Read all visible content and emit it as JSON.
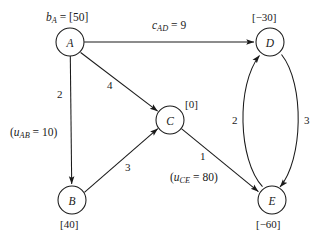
{
  "diagram": {
    "type": "network-flow-graph",
    "background_color": "#ffffff",
    "stroke_color": "#1a1a1a",
    "nodes": [
      {
        "id": "A",
        "letter": "A",
        "supply_label": "[50]",
        "supply_value": 50,
        "x": 70,
        "y": 42,
        "r": 14
      },
      {
        "id": "B",
        "letter": "B",
        "supply_label": "[40]",
        "supply_value": 40,
        "x": 72,
        "y": 200,
        "r": 14
      },
      {
        "id": "C",
        "letter": "C",
        "supply_label": "[0]",
        "supply_value": 0,
        "x": 170,
        "y": 120,
        "r": 14
      },
      {
        "id": "D",
        "letter": "D",
        "supply_label": "[−30]",
        "supply_value": -30,
        "x": 270,
        "y": 42,
        "r": 14
      },
      {
        "id": "E",
        "letter": "E",
        "supply_label": "[−60]",
        "supply_value": -60,
        "x": 272,
        "y": 200,
        "r": 14
      }
    ],
    "edges": [
      {
        "from": "A",
        "to": "D",
        "cost": 9,
        "cost_label": "9",
        "capacity": null,
        "shape": "straight"
      },
      {
        "from": "A",
        "to": "C",
        "cost": 4,
        "cost_label": "4",
        "capacity": null,
        "shape": "straight"
      },
      {
        "from": "A",
        "to": "B",
        "cost": 2,
        "cost_label": "2",
        "capacity": 10,
        "shape": "straight"
      },
      {
        "from": "B",
        "to": "C",
        "cost": 3,
        "cost_label": "3",
        "capacity": null,
        "shape": "straight"
      },
      {
        "from": "C",
        "to": "E",
        "cost": 1,
        "cost_label": "1",
        "capacity": 80,
        "shape": "straight"
      },
      {
        "from": "E",
        "to": "D",
        "cost": 2,
        "cost_label": "2",
        "capacity": null,
        "shape": "curved-left"
      },
      {
        "from": "D",
        "to": "E",
        "cost": 3,
        "cost_label": "3",
        "capacity": null,
        "shape": "curved-right"
      }
    ],
    "labels": {
      "node_a_supply_prefix": "b",
      "node_a_supply_subscript": "A",
      "node_a_supply_eq": " = ",
      "node_a_supply_value": "[50]",
      "node_d_supply": "[−30]",
      "node_c_supply": "[0]",
      "node_b_supply": "[40]",
      "node_e_supply": "[−60]",
      "cost_ad_prefix": "c",
      "cost_ad_subscript": "AD",
      "cost_ad_eq": " = ",
      "cost_ad_value": "9",
      "cost_ac": "4",
      "cost_ab": "2",
      "cost_bc": "3",
      "cost_ce": "1",
      "cost_ed": "2",
      "cost_de": "3",
      "cap_ab_open": "(",
      "cap_ab_prefix": "u",
      "cap_ab_subscript": "AB",
      "cap_ab_eq": " = ",
      "cap_ab_value": "10)",
      "cap_ce_open": "(",
      "cap_ce_prefix": "u",
      "cap_ce_subscript": "CE",
      "cap_ce_eq": " = ",
      "cap_ce_value": "80)"
    }
  }
}
